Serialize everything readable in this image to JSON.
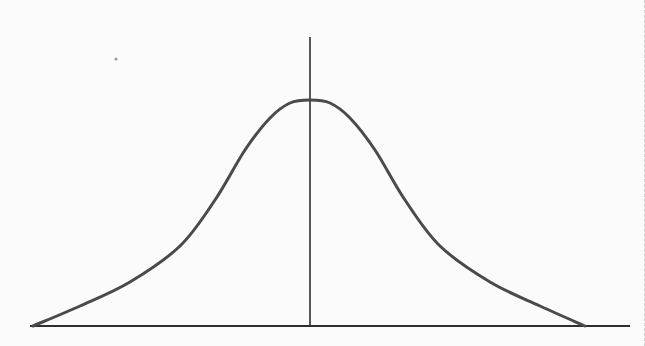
{
  "diagram": {
    "type": "normal-distribution-bell-curve",
    "colors": {
      "background": "#fbfbfb",
      "curve": "#4a4a4a",
      "axis": "#2e2e2e",
      "dot": "#9a9a9a"
    },
    "x_axis": {
      "x1": 30,
      "x2": 630,
      "y": 326
    },
    "y_axis": {
      "x": 310,
      "y1": 37,
      "y2": 326
    },
    "curve_points": [
      [
        33,
        326
      ],
      [
        80,
        306
      ],
      [
        130,
        282
      ],
      [
        180,
        246
      ],
      [
        215,
        200
      ],
      [
        245,
        150
      ],
      [
        270,
        118
      ],
      [
        290,
        103
      ],
      [
        310,
        100
      ],
      [
        330,
        103
      ],
      [
        350,
        118
      ],
      [
        375,
        150
      ],
      [
        405,
        200
      ],
      [
        440,
        246
      ],
      [
        490,
        282
      ],
      [
        540,
        306
      ],
      [
        585,
        326
      ]
    ],
    "stray_dot": {
      "x": 116,
      "y": 59
    }
  }
}
